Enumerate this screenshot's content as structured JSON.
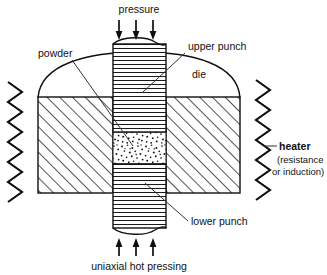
{
  "diagram": {
    "title": "uniaxial hot pressing",
    "labels": {
      "pressure": "pressure",
      "upper_punch": "upper punch",
      "lower_punch": "lower punch",
      "die": "die",
      "powder": "powder",
      "heater": "heater",
      "heater_sub_line1": "(resistance",
      "heater_sub_line2": "or induction)",
      "caption": "uniaxial hot pressing"
    },
    "colors": {
      "background": "#ffffff",
      "stroke": "#111111",
      "text": "#111111",
      "hatch": "#1a1a1a"
    },
    "arrows": {
      "top_count": 3,
      "top_direction": "down",
      "bottom_count": 3,
      "bottom_direction": "up"
    },
    "parts": [
      {
        "name": "upper-punch",
        "fill": "horizontal-hatch"
      },
      {
        "name": "lower-punch",
        "fill": "horizontal-hatch"
      },
      {
        "name": "die-left",
        "fill": "diagonal-hatch"
      },
      {
        "name": "die-right",
        "fill": "diagonal-hatch"
      },
      {
        "name": "powder",
        "fill": "stipple-dots"
      },
      {
        "name": "heater-left",
        "fill": "zigzag"
      },
      {
        "name": "heater-right",
        "fill": "zigzag"
      }
    ]
  }
}
